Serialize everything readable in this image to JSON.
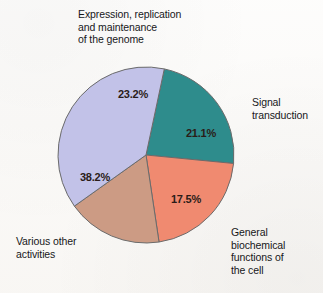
{
  "figure": {
    "background_color": "#fbfaf8"
  },
  "chart_data": {
    "type": "pie",
    "title": "",
    "subtitle": "",
    "xlabel": "",
    "ylabel": "",
    "legend_position": "callout-labels",
    "grid": false,
    "units": "percent",
    "start_angle_deg": 12,
    "direction": "clockwise",
    "categories": [
      "Expression, replication and maintenance of the genome",
      "Signal transduction",
      "General biochemical functions of the cell",
      "Various other activities"
    ],
    "values": [
      23.2,
      21.1,
      17.5,
      38.2
    ],
    "value_labels": [
      "23.2%",
      "21.1%",
      "17.5%",
      "38.2%"
    ],
    "colors": [
      "#2e8c8c",
      "#f08a70",
      "#cc9b84",
      "#c2c2e8"
    ],
    "slice_outline_color": "#6b6b6b",
    "total": 100.0
  },
  "labels": {
    "genome": "Expression, replication\nand maintenance\nof the genome",
    "signal": "Signal\ntransduction",
    "general": "General\nbiochemical\nfunctions of\nthe cell",
    "various": "Various other\nactivities"
  },
  "percentages": {
    "genome": "23.2%",
    "signal": "21.1%",
    "general": "17.5%",
    "various": "38.2%"
  }
}
